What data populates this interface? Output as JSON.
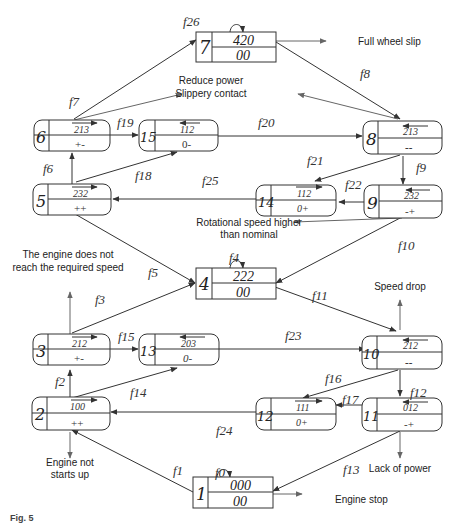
{
  "diagram": {
    "type": "state-transition-graph",
    "nodes": [
      {
        "id": "1",
        "top": "000",
        "bottom": "00",
        "shape": "rect"
      },
      {
        "id": "2",
        "top": "100",
        "bottom": "++",
        "shape": "rounded"
      },
      {
        "id": "3",
        "top": "212",
        "bottom": "+-",
        "shape": "rounded"
      },
      {
        "id": "4",
        "top": "222",
        "bottom": "00",
        "shape": "rect"
      },
      {
        "id": "5",
        "top": "232",
        "bottom": "++",
        "shape": "rounded"
      },
      {
        "id": "6",
        "top": "213",
        "bottom": "+-",
        "shape": "rounded"
      },
      {
        "id": "7",
        "top": "420",
        "bottom": "00",
        "shape": "rect"
      },
      {
        "id": "8",
        "top": "213",
        "bottom": "--",
        "shape": "rounded"
      },
      {
        "id": "9",
        "top": "232",
        "bottom": "-+",
        "shape": "rounded"
      },
      {
        "id": "10",
        "top": "212",
        "bottom": "--",
        "shape": "rounded"
      },
      {
        "id": "11",
        "top": "012",
        "bottom": "-+",
        "shape": "rounded"
      },
      {
        "id": "12",
        "top": "111",
        "bottom": "0+",
        "shape": "rounded"
      },
      {
        "id": "13",
        "top": "203",
        "bottom": "0-",
        "shape": "rounded"
      },
      {
        "id": "14",
        "top": "112",
        "bottom": "0+",
        "shape": "rounded"
      },
      {
        "id": "15",
        "top": "112",
        "bottom": "0-",
        "shape": "rounded"
      }
    ],
    "transitions": {
      "f0": "f0",
      "f1": "f1",
      "f2": "f2",
      "f3": "f3",
      "f4": "f4",
      "f5": "f5",
      "f6": "f6",
      "f7": "f7",
      "f8": "f8",
      "f9": "f9",
      "f10": "f10",
      "f11": "f11",
      "f12": "f12",
      "f13": "f13",
      "f14": "f14",
      "f15": "f15",
      "f16": "f16",
      "f17": "f17",
      "f18": "f18",
      "f19": "f19",
      "f20": "f20",
      "f21": "f21",
      "f22": "f22",
      "f23": "f23",
      "f24": "f24",
      "f25": "f25",
      "f26": "f26"
    },
    "edges": [
      {
        "label": "f0",
        "from": "1",
        "to": "1"
      },
      {
        "label": "f1",
        "from": "1",
        "to": "2"
      },
      {
        "label": "f2",
        "from": "2",
        "to": "3"
      },
      {
        "label": "f3",
        "from": "3",
        "to": "4"
      },
      {
        "label": "f4",
        "from": "4",
        "to": "4"
      },
      {
        "label": "f5",
        "from": "4",
        "to": "5"
      },
      {
        "label": "f6",
        "from": "5",
        "to": "6"
      },
      {
        "label": "f7",
        "from": "6",
        "to": "7"
      },
      {
        "label": "f8",
        "from": "7",
        "to": "8"
      },
      {
        "label": "f9",
        "from": "8",
        "to": "9"
      },
      {
        "label": "f10",
        "from": "9",
        "to": "4"
      },
      {
        "label": "f11",
        "from": "4",
        "to": "10"
      },
      {
        "label": "f12",
        "from": "10",
        "to": "11"
      },
      {
        "label": "f13",
        "from": "11",
        "to": "1"
      },
      {
        "label": "f14",
        "from": "2",
        "to": "13"
      },
      {
        "label": "f15",
        "from": "3",
        "to": "13"
      },
      {
        "label": "f16",
        "from": "10",
        "to": "12"
      },
      {
        "label": "f17",
        "from": "11",
        "to": "12"
      },
      {
        "label": "f18",
        "from": "5",
        "to": "15"
      },
      {
        "label": "f19",
        "from": "6",
        "to": "15"
      },
      {
        "label": "f20",
        "from": "15",
        "to": "8"
      },
      {
        "label": "f21",
        "from": "8",
        "to": "14"
      },
      {
        "label": "f22",
        "from": "9",
        "to": "14"
      },
      {
        "label": "f23",
        "from": "13",
        "to": "10"
      },
      {
        "label": "f24",
        "from": "12",
        "to": "2"
      },
      {
        "label": "f25",
        "from": "14",
        "to": "5"
      },
      {
        "label": "f26",
        "from": "7",
        "to": "7"
      }
    ],
    "notes": {
      "full_wheel_slip": "Full wheel slip",
      "reduce_power": "Reduce power",
      "slippery_contact": "Slippery contact",
      "rotational_1": "Rotational speed higher",
      "rotational_2": "than nominal",
      "engine_not_reach_1": "The engine does not",
      "engine_not_reach_2": "reach the required speed",
      "speed_drop": "Speed drop",
      "engine_not_starts_1": "Engine not",
      "engine_not_starts_2": "starts up",
      "lack_of_power": "Lack of power",
      "engine_stop": "Engine stop"
    },
    "caption": "Fig. 5"
  },
  "colors": {
    "line": "#333333",
    "arrow_gray": "#666666",
    "background": "#ffffff"
  }
}
